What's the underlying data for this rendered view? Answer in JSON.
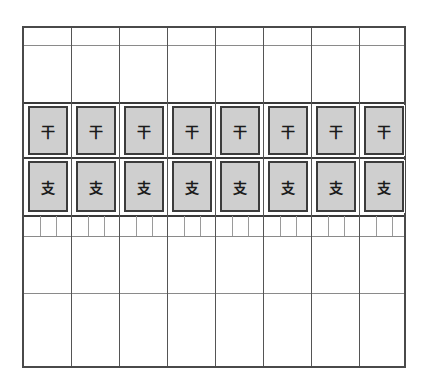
{
  "worksheet": {
    "columns": 8,
    "stem_row": {
      "label": "干",
      "cells": [
        "干",
        "干",
        "干",
        "干",
        "干",
        "干",
        "干",
        "干"
      ]
    },
    "branch_row": {
      "label": "支",
      "cells": [
        "支",
        "支",
        "支",
        "支",
        "支",
        "支",
        "支",
        "支"
      ]
    },
    "colors": {
      "box_fill": "#cfcfcf",
      "border": "#3c3c3c",
      "grid": "#555555"
    }
  }
}
